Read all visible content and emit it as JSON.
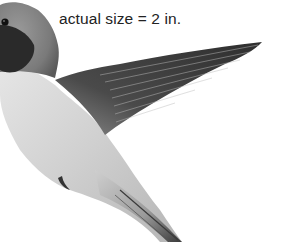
{
  "figure": {
    "style": "grayscale",
    "caption": "actual size = 2 in.",
    "edge_text_fragment": "t"
  },
  "colors": {
    "background": "#ffffff",
    "caption_text": "#222222",
    "throat_patch": "#2a2a2a",
    "wing_dark": "#3c3c3c",
    "body_light": "#d8d8d8"
  }
}
